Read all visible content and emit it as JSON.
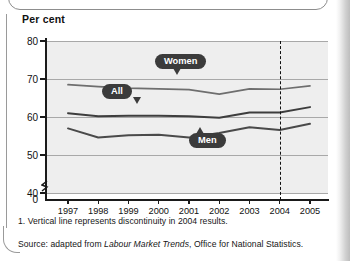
{
  "axis_title": "Per cent",
  "chart_data": {
    "type": "line",
    "title": "Per cent",
    "xlabel": "",
    "ylabel": "Per cent",
    "ylim": [
      40,
      80
    ],
    "yticks": [
      80,
      70,
      60,
      50,
      40,
      0
    ],
    "grid": true,
    "legend_position": "inline-callouts",
    "categories": [
      "1997",
      "1998",
      "1999",
      "2000",
      "2001",
      "2002",
      "2003",
      "2004",
      "2005"
    ],
    "series": [
      {
        "name": "Women",
        "values": [
          68.5,
          68.0,
          67.6,
          67.4,
          67.2,
          66.0,
          67.4,
          67.3,
          68.2
        ]
      },
      {
        "name": "All",
        "values": [
          61.0,
          60.2,
          60.3,
          60.3,
          60.2,
          59.8,
          61.2,
          61.2,
          62.6
        ]
      },
      {
        "name": "Men",
        "values": [
          57.0,
          54.6,
          55.2,
          55.3,
          54.6,
          55.8,
          57.3,
          56.6,
          58.2
        ]
      }
    ],
    "annotations": [
      {
        "label": "Women",
        "kind": "callout",
        "pointer": "down"
      },
      {
        "label": "All",
        "kind": "callout",
        "pointer": "down"
      },
      {
        "label": "Men",
        "kind": "callout",
        "pointer": "up"
      },
      {
        "label": "discontinuity-line",
        "kind": "vertical-dashed",
        "at": "2004"
      }
    ]
  },
  "colors": {
    "plot_background": "#eeeeee",
    "gridline": "#a8a8a8",
    "axis": "#1a1a1a",
    "series_women": "#6e6e6e",
    "series_all": "#3d3d3d",
    "series_men": "#4a4a4a",
    "callout_background": "#3b3b3b",
    "callout_text": "#ffffff"
  },
  "footnote": "1. Vertical line represents discontinuity in 2004 results.",
  "source": {
    "prefix": "Source: adapted from ",
    "italic": "Labour Market Trends",
    "suffix": ", Office for National Statistics."
  }
}
